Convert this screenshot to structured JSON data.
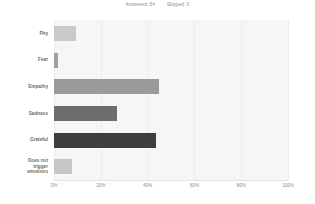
{
  "header": {
    "answered_label": "Answered: 54",
    "skipped_label": "Skipped: 0"
  },
  "chart_data": {
    "type": "bar",
    "orientation": "horizontal",
    "title": "",
    "xlabel": "",
    "ylabel": "",
    "xlim": [
      0,
      100
    ],
    "grid": true,
    "legend": "none",
    "categories": [
      "Pity",
      "Fear",
      "Empathy",
      "Sadness",
      "Grateful",
      "Does not trigger emotions"
    ],
    "values": [
      9.4,
      1.9,
      45.0,
      27.0,
      43.5,
      7.7
    ],
    "tick_labels": [
      "0%",
      "20%",
      "40%",
      "60%",
      "80%",
      "100%"
    ],
    "tick_values": [
      0,
      20,
      40,
      60,
      80,
      100
    ],
    "bar_colors": [
      "#c9c9c9",
      "#a0a0a0",
      "#9a9a9a",
      "#6d6d6d",
      "#3e3e3e",
      "#c6c6c6"
    ],
    "plot_background": "#f6f6f6",
    "gridline_color": "#ededed",
    "label_color": "#6b6b6b",
    "tick_color": "#8e8e8e"
  }
}
